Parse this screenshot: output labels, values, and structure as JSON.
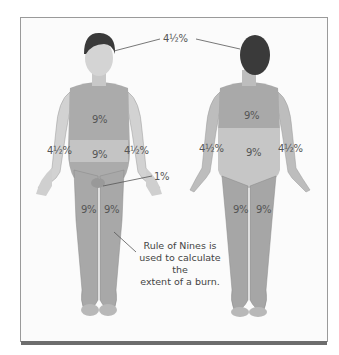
{
  "figure": {
    "title": "Rule of Nines",
    "caption": "Rule of Nines is used to calculate the extent of a burn.",
    "caption_lines": [
      "Rule of Nines is",
      "used to calculate the",
      "extent of a burn."
    ],
    "colors": {
      "frame_border": "#9a9a9a",
      "bottom_bar": "#6d6d6d",
      "skin": "#c8c8c8",
      "region": "#a9a9a9",
      "hair": "#3a3a3a",
      "text": "#555555"
    }
  },
  "labels": {
    "head": "4½%",
    "front": {
      "chest": "9%",
      "abdomen": "9%",
      "left_arm": "4½%",
      "right_arm": "4½%",
      "genitals": "1%",
      "left_leg": "9%",
      "right_leg": "9%"
    },
    "back": {
      "upper_back": "9%",
      "lower_back": "9%",
      "left_arm": "4½%",
      "right_arm": "4½%",
      "left_leg": "9%",
      "right_leg": "9%"
    }
  }
}
